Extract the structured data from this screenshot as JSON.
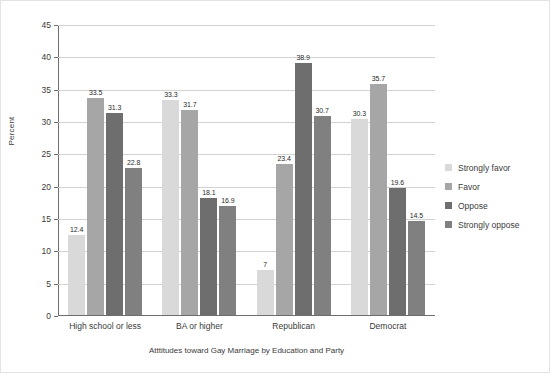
{
  "chart_data": {
    "type": "bar",
    "title": "",
    "xlabel": "Atttitudes toward Gay Marriage by Education and Party",
    "ylabel": "Percent",
    "ylim": [
      0,
      45
    ],
    "ytick_step": 5,
    "yticks": [
      "45",
      "40",
      "35",
      "30",
      "25",
      "20",
      "15",
      "10",
      "5",
      "0"
    ],
    "grid": "horizontal",
    "legend_position": "right",
    "categories": [
      "High school or less",
      "BA or higher",
      "Republican",
      "Democrat"
    ],
    "series": [
      {
        "name": "Strongly favor",
        "color": "#d9d9d9",
        "values": [
          12.4,
          33.3,
          7,
          30.3
        ],
        "labels": [
          "12.4",
          "33.3",
          "7",
          "30.3"
        ]
      },
      {
        "name": "Favor",
        "color": "#a6a6a6",
        "values": [
          33.5,
          31.7,
          23.4,
          35.7
        ],
        "labels": [
          "33.5",
          "31.7",
          "23.4",
          "35.7"
        ]
      },
      {
        "name": "Oppose",
        "color": "#6e6e6e",
        "values": [
          31.3,
          18.1,
          38.9,
          19.6
        ],
        "labels": [
          "31.3",
          "18.1",
          "38.9",
          "19.6"
        ]
      },
      {
        "name": "Strongly oppose",
        "color": "#808080",
        "values": [
          22.8,
          16.9,
          30.7,
          14.5
        ],
        "labels": [
          "22.8",
          "16.9",
          "30.7",
          "14.5"
        ]
      }
    ]
  }
}
